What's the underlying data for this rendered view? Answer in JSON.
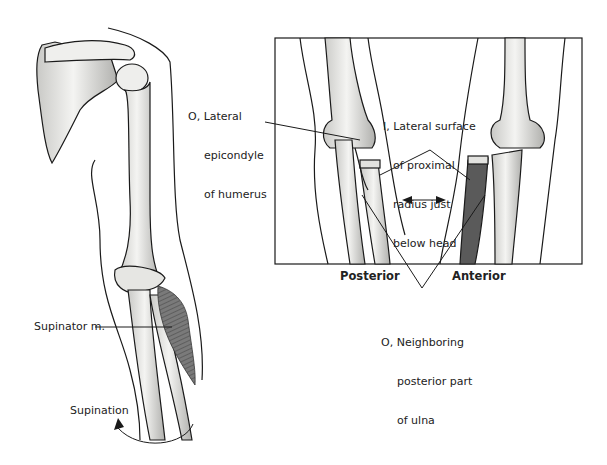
{
  "figure": {
    "left_panel": {
      "view": "Right shoulder and arm, posterior view",
      "labels": {
        "muscle": "Supinator m.",
        "motion": "Supination"
      }
    },
    "inset_panel": {
      "views": {
        "posterior": "Posterior",
        "anterior": "Anterior"
      },
      "labels": {
        "origin_humerus_l1": "O, Lateral",
        "origin_humerus_l2": "epicondyle",
        "origin_humerus_l3": "of humerus",
        "insertion_l1": "I, Lateral surface",
        "insertion_l2": "of proximal",
        "insertion_l3": "radius just",
        "insertion_l4": "below head",
        "origin_ulna_l1": "O, Neighboring",
        "origin_ulna_l2": "posterior part",
        "origin_ulna_l3": "of ulna"
      }
    },
    "colors": {
      "line": "#1a1a1a",
      "bone_fill": "#f2f2f0",
      "bone_shade": "#b8b8b5",
      "muscle": "#6f6f6f",
      "background": "#ffffff"
    }
  }
}
